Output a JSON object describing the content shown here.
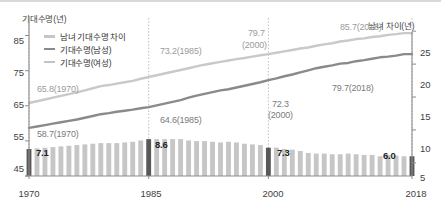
{
  "axes": {
    "left_title": "기대수명(년)",
    "right_title": "남녀 차이(년)",
    "left_ticks": [
      "85",
      "75",
      "65",
      "55",
      "45"
    ],
    "right_ticks": [
      "25",
      "20",
      "15",
      "10",
      "5"
    ],
    "x_ticks": [
      "1970",
      "1985",
      "2000",
      "2018"
    ]
  },
  "legend": {
    "items": [
      {
        "label": "남녀 기대수명 차이",
        "marker": "bar-swatch",
        "color": "#c6c6c6"
      },
      {
        "label": "기대수명(남성)",
        "marker": "line-swatch",
        "color": "#8a8a8a"
      },
      {
        "label": "기대수명(여성)",
        "marker": "line-swatch",
        "color": "#c3c3c3"
      }
    ]
  },
  "annotations": {
    "female": [
      "65.8(1970)",
      "73.2(1985)",
      "79.7\n(2000)",
      "85.7(2018)"
    ],
    "female_flat": [
      "65.8(1970)",
      "73.2(1985)",
      "79.7",
      "(2000)",
      "85.7(2018)"
    ],
    "male": [
      "58.7(1970)",
      "64.6(1985)",
      "72.3",
      "(2000)",
      "79.7(2018)"
    ],
    "gap": [
      "7.1",
      "8.6",
      "7.3",
      "6.0"
    ]
  },
  "colors": {
    "female_line": "#c9c9c9",
    "male_line": "#8a8a8a",
    "bar": "#c6c6c6",
    "bar_highlight": "#585858",
    "grid": "#bdbdbd",
    "axis": "#8c8c8c",
    "rule": "#d9d9d9"
  },
  "chart_data": {
    "type": "line",
    "title": "",
    "subtitle": "",
    "xlabel": "",
    "ylabel": "기대수명(년)",
    "y2label": "남녀 차이(년)",
    "ylim": [
      45,
      90
    ],
    "y2lim": [
      3,
      27
    ],
    "ytickvals": [
      45,
      55,
      65,
      75,
      85
    ],
    "y2tickvals": [
      5,
      10,
      15,
      20,
      25
    ],
    "grid": "vertical-dotted-at-year-ticks",
    "legend_position": "top-left-inside",
    "x": [
      1970,
      1971,
      1972,
      1973,
      1974,
      1975,
      1976,
      1977,
      1978,
      1979,
      1980,
      1981,
      1982,
      1983,
      1984,
      1985,
      1986,
      1987,
      1988,
      1989,
      1990,
      1991,
      1992,
      1993,
      1994,
      1995,
      1996,
      1997,
      1998,
      1999,
      2000,
      2001,
      2002,
      2003,
      2004,
      2005,
      2006,
      2007,
      2008,
      2009,
      2010,
      2011,
      2012,
      2013,
      2014,
      2015,
      2016,
      2017,
      2018
    ],
    "x_tick_labels": [
      "1970",
      "1985",
      "2000",
      "2018"
    ],
    "series": [
      {
        "name": "기대수명(여성)",
        "type": "line",
        "axis": "left",
        "color": "#c9c9c9",
        "values": [
          65.8,
          66.3,
          66.8,
          67.3,
          67.8,
          68.3,
          68.8,
          69.4,
          70.0,
          70.6,
          70.9,
          71.3,
          71.7,
          72.1,
          72.7,
          73.2,
          73.7,
          74.2,
          74.7,
          75.2,
          75.7,
          76.2,
          76.7,
          77.1,
          77.5,
          77.9,
          78.3,
          78.6,
          79.0,
          79.4,
          79.7,
          80.1,
          80.5,
          80.9,
          81.3,
          81.6,
          82.1,
          82.5,
          82.8,
          83.3,
          83.6,
          84.0,
          84.2,
          84.6,
          84.8,
          85.2,
          85.4,
          85.7,
          85.7
        ],
        "labeled_points": [
          {
            "x": 1970,
            "y": 65.8,
            "label": "65.8(1970)"
          },
          {
            "x": 1985,
            "y": 73.2,
            "label": "73.2(1985)"
          },
          {
            "x": 2000,
            "y": 79.7,
            "label": "79.7(2000)"
          },
          {
            "x": 2018,
            "y": 85.7,
            "label": "85.7(2018)"
          }
        ]
      },
      {
        "name": "기대수명(남성)",
        "type": "line",
        "axis": "left",
        "color": "#8a8a8a",
        "values": [
          58.7,
          59.1,
          59.5,
          59.9,
          60.3,
          60.7,
          61.1,
          61.6,
          62.1,
          62.6,
          62.9,
          63.3,
          63.6,
          63.9,
          64.3,
          64.6,
          65.1,
          65.6,
          66.1,
          66.6,
          67.3,
          67.9,
          68.4,
          68.9,
          69.4,
          69.7,
          70.2,
          70.7,
          71.2,
          71.7,
          72.3,
          72.8,
          73.4,
          73.9,
          74.5,
          75.1,
          75.7,
          76.1,
          76.5,
          77.0,
          77.2,
          77.7,
          78.0,
          78.4,
          78.8,
          79.0,
          79.3,
          79.7,
          79.7
        ],
        "labeled_points": [
          {
            "x": 1970,
            "y": 58.7,
            "label": "58.7(1970)"
          },
          {
            "x": 1985,
            "y": 64.6,
            "label": "64.6(1985)"
          },
          {
            "x": 2000,
            "y": 72.3,
            "label": "72.3(2000)"
          },
          {
            "x": 2018,
            "y": 79.7,
            "label": "79.7(2018)"
          }
        ]
      },
      {
        "name": "남녀 기대수명 차이",
        "type": "bar",
        "axis": "right",
        "color": "#c6c6c6",
        "highlight_color": "#585858",
        "highlight_x": [
          1970,
          1985,
          2000,
          2018
        ],
        "values": [
          7.1,
          7.2,
          7.3,
          7.4,
          7.5,
          7.6,
          7.7,
          7.8,
          7.9,
          8.0,
          8.0,
          8.0,
          8.1,
          8.2,
          8.4,
          8.6,
          8.6,
          8.6,
          8.6,
          8.6,
          8.4,
          8.3,
          8.3,
          8.2,
          8.1,
          8.2,
          8.1,
          7.9,
          7.8,
          7.7,
          7.3,
          7.3,
          7.1,
          7.0,
          6.8,
          6.5,
          6.4,
          6.4,
          6.3,
          6.3,
          6.4,
          6.3,
          6.2,
          6.2,
          6.0,
          6.2,
          6.1,
          6.0,
          6.0
        ],
        "labeled_points": [
          {
            "x": 1970,
            "y": 7.1,
            "label": "7.1"
          },
          {
            "x": 1985,
            "y": 8.6,
            "label": "8.6"
          },
          {
            "x": 2000,
            "y": 7.3,
            "label": "7.3"
          },
          {
            "x": 2018,
            "y": 6.0,
            "label": "6.0"
          }
        ]
      }
    ]
  }
}
